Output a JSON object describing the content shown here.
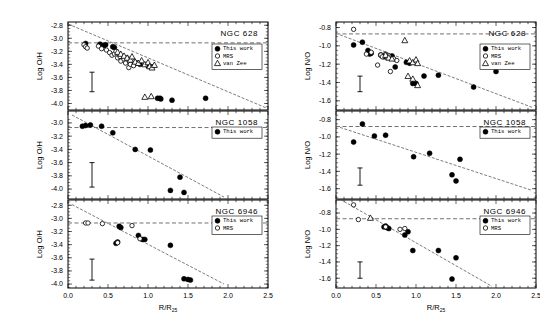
{
  "figure": {
    "title": "",
    "columns": [
      {
        "ylabel": "Log O/H"
      },
      {
        "ylabel": "Log N/O"
      }
    ],
    "xlabel": "R/R",
    "xlabel_sub": "25",
    "xticks": [
      "0.0",
      "0.5",
      "1.0",
      "1.5",
      "2.0",
      "2.5"
    ],
    "xlim": [
      0.0,
      2.5
    ]
  },
  "legend_labels": {
    "this_work": "This work",
    "mrs": "MRS",
    "van_zee": "van Zee"
  },
  "chart_data": [
    {
      "type": "scatter",
      "panel": "top-left",
      "title": "NGC 628",
      "xlabel": "R/R25",
      "ylabel": "Log O/H",
      "xlim": [
        0.0,
        2.5
      ],
      "ylim": [
        -4.1,
        -2.75
      ],
      "yticks": [
        -2.8,
        -3.0,
        -3.2,
        -3.4,
        -3.6,
        -3.8,
        -4.0
      ],
      "yticklabels": [
        "-2.8",
        "-3.0",
        "-3.2",
        "-3.4",
        "-3.6",
        "-3.8",
        "-4.0"
      ],
      "grid": false,
      "legend_position": "right",
      "hline": -3.07,
      "fit_line": {
        "x0": 0.0,
        "y0": -2.78,
        "x1": 2.5,
        "y1": -4.08
      },
      "errorbar": {
        "x": 0.3,
        "ylow": -3.82,
        "yhigh": -3.52
      },
      "series": [
        {
          "name": "This work",
          "marker": "filled-circle",
          "points": [
            [
              0.22,
              -3.08
            ],
            [
              0.4,
              -3.09
            ],
            [
              0.45,
              -3.11
            ],
            [
              0.47,
              -3.1
            ],
            [
              0.56,
              -3.13
            ],
            [
              0.58,
              -3.14
            ],
            [
              0.86,
              -3.38
            ],
            [
              0.9,
              -3.4
            ],
            [
              1.0,
              -3.42
            ],
            [
              1.05,
              -3.44
            ],
            [
              1.12,
              -3.92
            ],
            [
              1.15,
              -3.92
            ],
            [
              1.16,
              -3.93
            ],
            [
              1.3,
              -3.95
            ],
            [
              1.72,
              -3.92
            ],
            [
              2.05,
              -3.38
            ]
          ]
        },
        {
          "name": "MRS",
          "marker": "open-circle",
          "points": [
            [
              0.2,
              -3.1
            ],
            [
              0.22,
              -3.13
            ],
            [
              0.24,
              -3.15
            ],
            [
              0.38,
              -3.12
            ],
            [
              0.42,
              -3.16
            ],
            [
              0.48,
              -3.18
            ],
            [
              0.52,
              -3.22
            ],
            [
              0.55,
              -3.26
            ],
            [
              0.58,
              -3.24
            ],
            [
              0.6,
              -3.2
            ],
            [
              0.62,
              -3.3
            ],
            [
              0.65,
              -3.28
            ],
            [
              0.66,
              -3.35
            ],
            [
              0.7,
              -3.32
            ],
            [
              0.72,
              -3.38
            ],
            [
              0.74,
              -3.3
            ],
            [
              0.76,
              -3.45
            ],
            [
              0.78,
              -3.4
            ],
            [
              0.8,
              -3.34
            ],
            [
              0.82,
              -3.42
            ]
          ]
        },
        {
          "name": "van Zee",
          "marker": "open-triangle",
          "points": [
            [
              0.62,
              -3.21
            ],
            [
              0.66,
              -3.24
            ],
            [
              0.7,
              -3.27
            ],
            [
              0.74,
              -3.3
            ],
            [
              0.78,
              -3.33
            ],
            [
              0.8,
              -3.28
            ],
            [
              0.84,
              -3.36
            ],
            [
              0.88,
              -3.38
            ],
            [
              0.92,
              -3.34
            ],
            [
              0.96,
              -3.4
            ],
            [
              1.0,
              -3.37
            ],
            [
              1.02,
              -3.43
            ],
            [
              1.05,
              -3.45
            ],
            [
              1.08,
              -3.41
            ],
            [
              0.96,
              -3.9
            ],
            [
              1.04,
              -3.89
            ]
          ]
        }
      ]
    },
    {
      "type": "scatter",
      "panel": "middle-left",
      "title": "NGC 1058",
      "xlabel": "R/R25",
      "ylabel": "Log O/H",
      "xlim": [
        0.0,
        2.5
      ],
      "ylim": [
        -4.15,
        -2.82
      ],
      "yticks": [
        -3.0,
        -3.2,
        -3.4,
        -3.6,
        -3.8,
        -4.0
      ],
      "yticklabels": [
        "-3.0",
        "-3.2",
        "-3.4",
        "-3.6",
        "-3.8",
        "-4.0"
      ],
      "grid": false,
      "legend_position": "right",
      "hline": -3.07,
      "fit_line": {
        "x0": 0.05,
        "y0": -2.88,
        "x1": 1.95,
        "y1": -4.12
      },
      "errorbar": {
        "x": 0.3,
        "ylow": -3.97,
        "yhigh": -3.6
      },
      "series": [
        {
          "name": "This work",
          "marker": "filled-circle",
          "points": [
            [
              0.18,
              -3.05
            ],
            [
              0.22,
              -3.04
            ],
            [
              0.28,
              -3.03
            ],
            [
              0.42,
              -3.05
            ],
            [
              0.56,
              -3.15
            ],
            [
              0.84,
              -3.4
            ],
            [
              1.03,
              -3.41
            ],
            [
              1.4,
              -3.82
            ],
            [
              1.28,
              -4.02
            ],
            [
              1.45,
              -4.05
            ]
          ]
        }
      ]
    },
    {
      "type": "scatter",
      "panel": "bottom-left",
      "title": "NGC 6946",
      "xlabel": "R/R25",
      "ylabel": "Log O/H",
      "xlim": [
        0.0,
        2.5
      ],
      "ylim": [
        -4.06,
        -2.72
      ],
      "yticks": [
        -2.8,
        -3.0,
        -3.2,
        -3.4,
        -3.6,
        -3.8,
        -4.0
      ],
      "yticklabels": [
        "-2.8",
        "-3.0",
        "-3.2",
        "-3.4",
        "-3.6",
        "-3.8",
        "-4.0"
      ],
      "grid": false,
      "legend_position": "right",
      "hline": -3.07,
      "fit_line": {
        "x0": 0.05,
        "y0": -2.79,
        "x1": 1.95,
        "y1": -4.0
      },
      "errorbar": {
        "x": 0.3,
        "ylow": -3.94,
        "yhigh": -3.62
      },
      "series": [
        {
          "name": "This work",
          "marker": "filled-circle",
          "points": [
            [
              0.62,
              -3.36
            ],
            [
              0.6,
              -3.38
            ],
            [
              0.64,
              -3.12
            ],
            [
              0.66,
              -3.14
            ],
            [
              0.88,
              -3.26
            ],
            [
              0.93,
              -3.32
            ],
            [
              0.96,
              -3.32
            ],
            [
              1.28,
              -3.41
            ],
            [
              1.45,
              -3.92
            ],
            [
              1.5,
              -3.93
            ],
            [
              1.53,
              -3.94
            ]
          ]
        },
        {
          "name": "MRS",
          "marker": "open-circle",
          "points": [
            [
              0.22,
              -3.07
            ],
            [
              0.25,
              -3.07
            ],
            [
              0.43,
              -3.08
            ],
            [
              0.62,
              -3.37
            ],
            [
              0.8,
              -3.11
            ],
            [
              0.9,
              -3.31
            ]
          ]
        }
      ]
    },
    {
      "type": "scatter",
      "panel": "top-right",
      "title": "NGC 628",
      "xlabel": "R/R25",
      "ylabel": "Log N/O",
      "xlim": [
        0.0,
        2.5
      ],
      "ylim": [
        -1.7,
        -0.74
      ],
      "yticks": [
        -0.8,
        -1.0,
        -1.2,
        -1.4,
        -1.6
      ],
      "yticklabels": [
        "-0.8",
        "-1.0",
        "-1.2",
        "-1.4",
        "-1.6"
      ],
      "grid": false,
      "legend_position": "right",
      "hline": -0.87,
      "fit_line": {
        "x0": 0.05,
        "y0": -0.88,
        "x1": 2.45,
        "y1": -1.67
      },
      "errorbar": {
        "x": 0.3,
        "ylow": -1.5,
        "yhigh": -1.33
      },
      "series": [
        {
          "name": "This work",
          "marker": "filled-circle",
          "points": [
            [
              0.22,
              -0.99
            ],
            [
              0.33,
              -0.96
            ],
            [
              0.4,
              -1.05
            ],
            [
              0.42,
              -1.09
            ],
            [
              0.44,
              -1.08
            ],
            [
              0.56,
              -1.1
            ],
            [
              0.58,
              -1.11
            ],
            [
              0.6,
              -1.12
            ],
            [
              0.64,
              -1.12
            ],
            [
              0.68,
              -1.13
            ],
            [
              0.7,
              -1.11
            ],
            [
              0.74,
              -1.23
            ],
            [
              0.88,
              -1.18
            ],
            [
              0.92,
              -1.19
            ],
            [
              0.96,
              -1.41
            ],
            [
              1.0,
              -1.41
            ],
            [
              1.1,
              -1.33
            ],
            [
              1.28,
              -1.32
            ],
            [
              1.72,
              -1.45
            ],
            [
              2.0,
              -1.28
            ]
          ]
        },
        {
          "name": "MRS",
          "marker": "open-circle",
          "points": [
            [
              0.22,
              -0.82
            ],
            [
              0.38,
              -1.09
            ],
            [
              0.44,
              -1.07
            ],
            [
              0.52,
              -1.21
            ],
            [
              0.56,
              -1.1
            ],
            [
              0.58,
              -1.12
            ],
            [
              0.62,
              -1.09
            ],
            [
              0.64,
              -1.13
            ],
            [
              0.66,
              -1.11
            ],
            [
              0.68,
              -1.28
            ],
            [
              0.72,
              -1.14
            ],
            [
              0.76,
              -1.16
            ]
          ]
        },
        {
          "name": "van Zee",
          "marker": "open-triangle",
          "points": [
            [
              0.62,
              -1.1
            ],
            [
              0.66,
              -1.13
            ],
            [
              0.7,
              -1.14
            ],
            [
              0.86,
              -0.94
            ],
            [
              0.92,
              -1.16
            ],
            [
              0.96,
              -1.18
            ],
            [
              1.0,
              -1.15
            ],
            [
              1.02,
              -1.19
            ],
            [
              0.9,
              -1.33
            ],
            [
              0.96,
              -1.36
            ],
            [
              1.02,
              -1.43
            ]
          ]
        }
      ]
    },
    {
      "type": "scatter",
      "panel": "middle-right",
      "title": "NGC 1058",
      "xlabel": "R/R25",
      "ylabel": "Log N/O",
      "xlim": [
        0.0,
        2.5
      ],
      "ylim": [
        -1.72,
        -0.7
      ],
      "yticks": [
        -0.8,
        -1.0,
        -1.2,
        -1.4,
        -1.6
      ],
      "yticklabels": [
        "-0.8",
        "-1.0",
        "-1.2",
        "-1.4",
        "-1.6"
      ],
      "grid": false,
      "legend_position": "right",
      "hline": -0.88,
      "fit_line": {
        "x0": 0.05,
        "y0": -0.89,
        "x1": 2.45,
        "y1": -1.62
      },
      "errorbar": {
        "x": 0.3,
        "ylow": -1.56,
        "yhigh": -1.36
      },
      "series": [
        {
          "name": "This work",
          "marker": "filled-circle",
          "points": [
            [
              0.22,
              -1.06
            ],
            [
              0.33,
              -0.85
            ],
            [
              0.48,
              -0.99
            ],
            [
              0.62,
              -0.98
            ],
            [
              0.97,
              -1.23
            ],
            [
              1.17,
              -1.19
            ],
            [
              1.45,
              -1.44
            ],
            [
              1.55,
              -1.26
            ],
            [
              1.5,
              -1.51
            ]
          ]
        }
      ]
    },
    {
      "type": "scatter",
      "panel": "bottom-right",
      "title": "NGC 6946",
      "xlabel": "R/R25",
      "ylabel": "Log N/O",
      "xlim": [
        0.0,
        2.5
      ],
      "ylim": [
        -1.72,
        -0.64
      ],
      "yticks": [
        -0.8,
        -1.0,
        -1.2,
        -1.4,
        -1.6
      ],
      "yticklabels": [
        "-0.8",
        "-1.0",
        "-1.2",
        "-1.4",
        "-1.6"
      ],
      "grid": false,
      "legend_position": "right",
      "hline": -0.87,
      "fit_line": {
        "x0": 0.05,
        "y0": -0.63,
        "x1": 1.95,
        "y1": -1.7
      },
      "errorbar": {
        "x": 0.3,
        "ylow": -1.6,
        "yhigh": -1.4
      },
      "series": [
        {
          "name": "This work",
          "marker": "filled-circle",
          "points": [
            [
              0.6,
              -0.97
            ],
            [
              0.62,
              -0.96
            ],
            [
              0.64,
              -0.98
            ],
            [
              0.66,
              -0.99
            ],
            [
              0.86,
              -1.07
            ],
            [
              0.9,
              -1.03
            ],
            [
              0.96,
              -1.26
            ],
            [
              1.28,
              -1.26
            ],
            [
              1.5,
              -1.35
            ],
            [
              1.45,
              -1.61
            ]
          ]
        },
        {
          "name": "MRS",
          "marker": "open-circle",
          "points": [
            [
              0.22,
              -0.7
            ],
            [
              0.28,
              -0.88
            ],
            [
              0.62,
              -0.97
            ],
            [
              0.8,
              -1.0
            ],
            [
              0.86,
              -0.99
            ]
          ]
        }
      ]
    },
    {
      "type": "scatter",
      "panel": "bottom-right-vanzee",
      "title": "",
      "series": [
        {
          "name": "van Zee",
          "marker": "open-triangle",
          "points": [
            [
              0.43,
              -0.86
            ]
          ]
        }
      ]
    }
  ],
  "colors": {
    "axis": "#000000",
    "marker_fill": "#000000",
    "marker_open": "#ffffff",
    "fit_line": "#444444",
    "hline": "#333333"
  }
}
